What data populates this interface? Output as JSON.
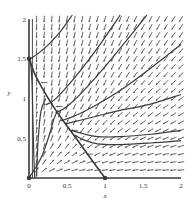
{
  "chart_data": {
    "type": "phase_portrait",
    "title": "",
    "xlabel": "x",
    "ylabel": "y",
    "xlim": [
      0,
      2
    ],
    "ylim": [
      0,
      2
    ],
    "x_ticks": [
      "0",
      "0.5",
      "1",
      "1.5",
      "2"
    ],
    "y_ticks": [
      "0.5",
      "1",
      "1.5",
      "2"
    ],
    "origin_label": "0",
    "grid": false,
    "legend": null,
    "equilibria": [
      {
        "x": 0,
        "y": 0
      },
      {
        "x": 1,
        "y": 0
      },
      {
        "x": 0,
        "y": 1.5
      }
    ],
    "direction_field": {
      "description": "small arrows on a regular grid, pointing down-left in the upper-right region, leftward near the x-axis, upward near the y-axis",
      "grid_step": 0.1
    },
    "trajectories": [
      {
        "name": "separatrix",
        "points": [
          [
            0,
            1.5
          ],
          [
            0.08,
            1.3
          ],
          [
            0.18,
            1.12
          ],
          [
            0.3,
            0.93
          ],
          [
            0.45,
            0.72
          ],
          [
            0.62,
            0.5
          ],
          [
            0.8,
            0.26
          ],
          [
            1,
            0
          ]
        ]
      },
      {
        "name": "t1",
        "points": [
          [
            0.57,
            2.05
          ],
          [
            0.42,
            1.85
          ],
          [
            0.28,
            1.7
          ],
          [
            0.14,
            1.58
          ],
          [
            0.02,
            1.5
          ]
        ]
      },
      {
        "name": "t2",
        "points": [
          [
            1.2,
            2.05
          ],
          [
            0.95,
            1.7
          ],
          [
            0.7,
            1.38
          ],
          [
            0.5,
            1.15
          ],
          [
            0.33,
            0.98
          ],
          [
            0.22,
            0.92
          ]
        ]
      },
      {
        "name": "t3",
        "points": [
          [
            1.55,
            2.05
          ],
          [
            1.3,
            1.75
          ],
          [
            1.0,
            1.4
          ],
          [
            0.72,
            1.1
          ],
          [
            0.5,
            0.9
          ],
          [
            0.35,
            0.82
          ]
        ]
      },
      {
        "name": "t4",
        "points": [
          [
            2.0,
            1.68
          ],
          [
            1.6,
            1.38
          ],
          [
            1.2,
            1.1
          ],
          [
            0.85,
            0.9
          ],
          [
            0.6,
            0.78
          ],
          [
            0.42,
            0.72
          ]
        ]
      },
      {
        "name": "t5",
        "points": [
          [
            2.0,
            1.05
          ],
          [
            1.6,
            0.93
          ],
          [
            1.2,
            0.85
          ],
          [
            0.9,
            0.78
          ],
          [
            0.65,
            0.72
          ],
          [
            0.48,
            0.68
          ]
        ]
      },
      {
        "name": "t6",
        "points": [
          [
            2.0,
            0.6
          ],
          [
            1.6,
            0.55
          ],
          [
            1.2,
            0.52
          ],
          [
            0.9,
            0.52
          ],
          [
            0.7,
            0.56
          ],
          [
            0.55,
            0.6
          ]
        ]
      },
      {
        "name": "t7",
        "points": [
          [
            2.0,
            0.47
          ],
          [
            1.6,
            0.44
          ],
          [
            1.2,
            0.42
          ],
          [
            0.9,
            0.43
          ],
          [
            0.72,
            0.48
          ],
          [
            0.6,
            0.54
          ]
        ]
      },
      {
        "name": "t8",
        "points": [
          [
            0.02,
            1.48
          ],
          [
            0.04,
            1.2
          ],
          [
            0.05,
            0.8
          ],
          [
            0.06,
            0.4
          ],
          [
            0.07,
            0.1
          ],
          [
            0.08,
            0.0
          ]
        ]
      },
      {
        "name": "t9",
        "points": [
          [
            0.1,
            0.02
          ],
          [
            0.11,
            0.3
          ],
          [
            0.13,
            0.6
          ],
          [
            0.16,
            0.85
          ],
          [
            0.22,
            1.0
          ]
        ]
      },
      {
        "name": "t10",
        "points": [
          [
            0.0,
            0.0
          ],
          [
            0.08,
            0.12
          ],
          [
            0.18,
            0.3
          ],
          [
            0.27,
            0.55
          ],
          [
            0.33,
            0.75
          ],
          [
            0.38,
            0.85
          ]
        ]
      }
    ],
    "axes_lines": [
      {
        "from": [
          0,
          0
        ],
        "to": [
          0,
          2
        ],
        "role": "y-axis (invariant)"
      },
      {
        "from": [
          0,
          0
        ],
        "to": [
          2,
          0
        ],
        "role": "x-axis (invariant)"
      }
    ]
  },
  "colors": {
    "background": "#ffffff",
    "curve": "#3a3a3a",
    "arrow": "#555555",
    "text": "#333333"
  }
}
